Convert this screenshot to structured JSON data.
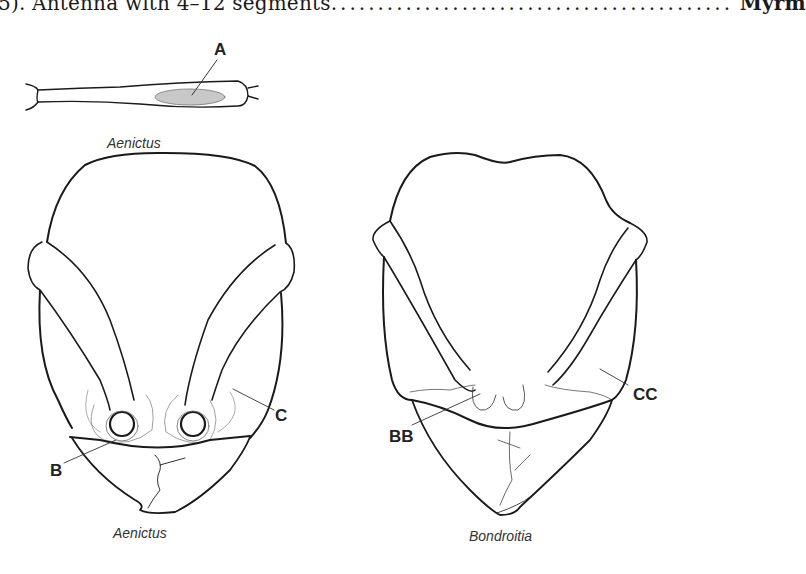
{
  "key_line": {
    "prefix": "5). Antenna with 4–12 segments",
    "dots": "...........................................",
    "taxon": "Myrm"
  },
  "figures": {
    "antenna": {
      "caption": "Aenictus",
      "label": "A"
    },
    "head_left": {
      "caption": "Aenictus",
      "labels": [
        "B",
        "C"
      ]
    },
    "head_right": {
      "caption": "Bondroitia",
      "labels": [
        "BB",
        "CC"
      ]
    }
  },
  "colors": {
    "line": "#1a1a1a",
    "fine_line": "#555555",
    "highlight": "#c8c8c8"
  }
}
